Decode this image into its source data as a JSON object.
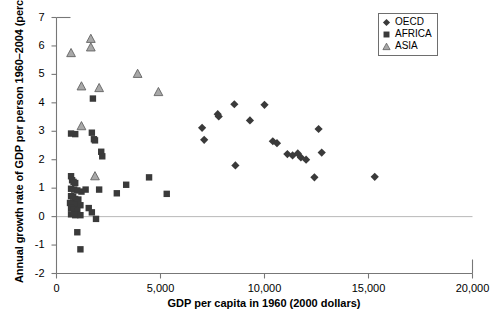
{
  "chart_data": {
    "type": "scatter",
    "title": "",
    "xlabel": "GDP per capita in 1960 (2000 dollars)",
    "ylabel": "Annual growth rate of GDP per person 1960–2004 (percent)",
    "xlim": [
      0,
      20000
    ],
    "ylim": [
      -2,
      7
    ],
    "xticks": [
      0,
      5000,
      10000,
      15000,
      20000
    ],
    "xticklabels": [
      "0",
      "5,000",
      "10,000",
      "15,000",
      "20,000"
    ],
    "yticks": [
      -2,
      -1,
      0,
      1,
      2,
      3,
      4,
      5,
      6,
      7
    ],
    "yticklabels": [
      "-2",
      "-1",
      "0",
      "1",
      "2",
      "3",
      "4",
      "5",
      "6",
      "7"
    ],
    "grid": false,
    "zero_line": true,
    "legend_position": "top-right",
    "series": [
      {
        "name": "OECD",
        "marker": "diamond",
        "color": "#3a3a3a",
        "points": [
          [
            7100,
            2.7
          ],
          [
            7750,
            3.6
          ],
          [
            7800,
            3.52
          ],
          [
            7000,
            3.12
          ],
          [
            8550,
            3.95
          ],
          [
            9300,
            3.38
          ],
          [
            10000,
            3.93
          ],
          [
            8600,
            1.8
          ],
          [
            10400,
            2.65
          ],
          [
            10600,
            2.58
          ],
          [
            11100,
            2.2
          ],
          [
            11350,
            2.15
          ],
          [
            11600,
            2.22
          ],
          [
            11750,
            2.08
          ],
          [
            12000,
            2.0
          ],
          [
            12600,
            3.08
          ],
          [
            12750,
            2.25
          ],
          [
            12400,
            1.38
          ],
          [
            15300,
            1.4
          ]
        ]
      },
      {
        "name": "AFRICA",
        "marker": "square",
        "color": "#3a3a3a",
        "points": [
          [
            700,
            2.92
          ],
          [
            900,
            2.9
          ],
          [
            1750,
            4.15
          ],
          [
            1700,
            2.95
          ],
          [
            1800,
            2.72
          ],
          [
            1850,
            2.68
          ],
          [
            2150,
            2.28
          ],
          [
            2200,
            2.12
          ],
          [
            3350,
            1.12
          ],
          [
            4450,
            1.38
          ],
          [
            700,
            1.42
          ],
          [
            750,
            1.28
          ],
          [
            820,
            1.22
          ],
          [
            900,
            1.18
          ],
          [
            700,
            0.98
          ],
          [
            850,
            0.95
          ],
          [
            1000,
            0.92
          ],
          [
            1200,
            0.88
          ],
          [
            700,
            0.72
          ],
          [
            800,
            0.7
          ],
          [
            900,
            0.62
          ],
          [
            1050,
            0.6
          ],
          [
            650,
            0.48
          ],
          [
            780,
            0.45
          ],
          [
            900,
            0.42
          ],
          [
            1150,
            0.4
          ],
          [
            700,
            0.3
          ],
          [
            850,
            0.25
          ],
          [
            1000,
            0.22
          ],
          [
            1400,
            0.95
          ],
          [
            2050,
            0.95
          ],
          [
            2900,
            0.82
          ],
          [
            5300,
            0.8
          ],
          [
            1550,
            0.3
          ],
          [
            1700,
            0.15
          ],
          [
            700,
            0.08
          ],
          [
            900,
            0.05
          ],
          [
            1150,
            0.05
          ],
          [
            1900,
            -0.08
          ],
          [
            1000,
            -0.55
          ],
          [
            1150,
            -1.15
          ]
        ]
      },
      {
        "name": "ASIA",
        "marker": "triangle",
        "color": "#a8a8a8",
        "points": [
          [
            700,
            5.75
          ],
          [
            1650,
            6.25
          ],
          [
            1650,
            5.95
          ],
          [
            1200,
            4.58
          ],
          [
            2050,
            4.52
          ],
          [
            3900,
            5.02
          ],
          [
            4900,
            4.38
          ],
          [
            1200,
            3.18
          ],
          [
            1850,
            1.42
          ]
        ]
      }
    ]
  },
  "legend": {
    "items": [
      {
        "label": "OECD",
        "marker": "diamond"
      },
      {
        "label": "AFRICA",
        "marker": "square"
      },
      {
        "label": "ASIA",
        "marker": "triangle"
      }
    ]
  }
}
